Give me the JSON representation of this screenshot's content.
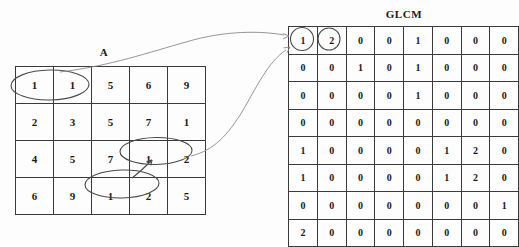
{
  "figure": {
    "kind": "glcm-illustration",
    "background_color": "#fdfdfd",
    "ink_color": "#4a4a4a"
  },
  "source_matrix": {
    "title": "A",
    "rows": 4,
    "cols": 5,
    "values": [
      [
        1,
        1,
        5,
        6,
        9
      ],
      [
        2,
        3,
        5,
        7,
        1
      ],
      [
        4,
        5,
        7,
        1,
        2
      ],
      [
        6,
        9,
        1,
        2,
        5
      ]
    ],
    "highlights": [
      {
        "name": "pair-row1-col1-col2",
        "row": 0,
        "col_start": 0,
        "col_end": 1,
        "values": [
          1,
          1
        ]
      },
      {
        "name": "pair-row3-col4-col5",
        "row": 2,
        "col_start": 3,
        "col_end": 4,
        "values": [
          1,
          2
        ]
      },
      {
        "name": "pair-row4-col3-col4",
        "row": 3,
        "col_start": 2,
        "col_end": 3,
        "values": [
          1,
          2
        ]
      }
    ]
  },
  "glcm_matrix": {
    "title": "GLCM",
    "rows": 8,
    "cols": 8,
    "values": [
      [
        1,
        2,
        0,
        0,
        1,
        0,
        0,
        0
      ],
      [
        0,
        0,
        1,
        0,
        1,
        0,
        0,
        0
      ],
      [
        0,
        0,
        0,
        0,
        1,
        0,
        0,
        0
      ],
      [
        0,
        0,
        0,
        0,
        0,
        0,
        0,
        0
      ],
      [
        1,
        0,
        0,
        0,
        0,
        1,
        2,
        0
      ],
      [
        1,
        0,
        0,
        0,
        0,
        1,
        2,
        0
      ],
      [
        0,
        0,
        0,
        0,
        0,
        0,
        0,
        1
      ],
      [
        2,
        0,
        0,
        0,
        0,
        0,
        0,
        0
      ]
    ],
    "highlights": [
      {
        "name": "cell-r1c1",
        "row": 0,
        "col": 0,
        "value": 1
      },
      {
        "name": "cell-r1c2",
        "row": 0,
        "col": 1,
        "value": 2
      }
    ]
  },
  "connectors": [
    {
      "name": "connector-upper",
      "from": "A row1 pair (1,1)",
      "to": "GLCM cell (1,1)",
      "arrow": true
    },
    {
      "name": "connector-lower",
      "from": "A row3 pair (1,2)",
      "to": "GLCM cell (1,2)",
      "arrow": true
    },
    {
      "name": "connector-internal",
      "from": "A row4 pair (1,2)",
      "to": "A row3 pair (1,2)",
      "arrow": true
    }
  ]
}
